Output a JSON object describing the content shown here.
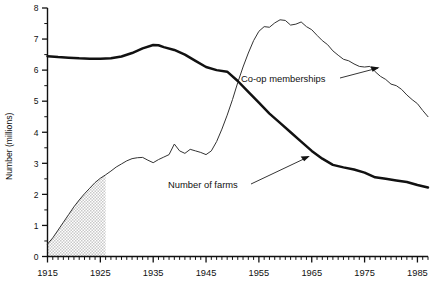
{
  "chart_data": {
    "type": "line",
    "title": "",
    "xlabel": "",
    "ylabel": "Number (millions)",
    "xlim": [
      1915,
      1987
    ],
    "ylim": [
      0,
      8
    ],
    "grid": false,
    "legend_position": "inline-annotations",
    "x_ticks": [
      1915,
      1925,
      1935,
      1945,
      1955,
      1965,
      1975,
      1985
    ],
    "x_tick_labels": [
      "1915",
      "1925",
      "1935",
      "1945",
      "1955",
      "1965",
      "1975",
      "1985"
    ],
    "x_minor_tick_interval": 1,
    "y_ticks": [
      0,
      1,
      2,
      3,
      4,
      5,
      6,
      7,
      8
    ],
    "y_tick_labels": [
      "0",
      "1",
      "2",
      "3",
      "4",
      "5",
      "6",
      "7",
      "8"
    ],
    "y_minor_tick_interval": 0.5,
    "annotations": [
      {
        "text": "Co-op memberships",
        "points_to": "coop-series"
      },
      {
        "text": "Number of farms",
        "points_to": "farms-series"
      }
    ],
    "shaded_region": {
      "label": "estimated",
      "x_from": 1915,
      "x_to": 1926,
      "under_series": "Co-op memberships"
    },
    "series": [
      {
        "name": "Number of farms",
        "style": "thick",
        "x": [
          1915,
          1917,
          1919,
          1921,
          1923,
          1925,
          1927,
          1929,
          1931,
          1933,
          1935,
          1936,
          1937,
          1939,
          1941,
          1943,
          1945,
          1947,
          1949,
          1951,
          1953,
          1955,
          1957,
          1959,
          1961,
          1963,
          1965,
          1967,
          1969,
          1971,
          1973,
          1975,
          1977,
          1979,
          1981,
          1983,
          1985,
          1987
        ],
        "values": [
          6.45,
          6.42,
          6.4,
          6.38,
          6.37,
          6.37,
          6.38,
          6.44,
          6.55,
          6.7,
          6.81,
          6.8,
          6.74,
          6.65,
          6.5,
          6.3,
          6.1,
          6.0,
          5.95,
          5.65,
          5.3,
          4.95,
          4.6,
          4.3,
          4.0,
          3.7,
          3.4,
          3.15,
          2.95,
          2.87,
          2.8,
          2.7,
          2.55,
          2.5,
          2.45,
          2.4,
          2.3,
          2.22
        ]
      },
      {
        "name": "Co-op memberships",
        "style": "thin",
        "x": [
          1915,
          1916,
          1917,
          1918,
          1919,
          1920,
          1921,
          1922,
          1923,
          1924,
          1925,
          1926,
          1927,
          1928,
          1929,
          1930,
          1931,
          1932,
          1933,
          1934,
          1935,
          1936,
          1937,
          1938,
          1939,
          1940,
          1941,
          1942,
          1943,
          1944,
          1945,
          1946,
          1947,
          1948,
          1949,
          1950,
          1951,
          1952,
          1953,
          1954,
          1955,
          1956,
          1957,
          1958,
          1959,
          1960,
          1961,
          1962,
          1963,
          1964,
          1965,
          1966,
          1967,
          1968,
          1969,
          1970,
          1971,
          1972,
          1973,
          1974,
          1975,
          1976,
          1977,
          1978,
          1979,
          1980,
          1981,
          1982,
          1983,
          1984,
          1985,
          1986,
          1987
        ],
        "values": [
          0.4,
          0.6,
          0.85,
          1.1,
          1.35,
          1.6,
          1.82,
          2.02,
          2.2,
          2.38,
          2.52,
          2.63,
          2.75,
          2.88,
          2.98,
          3.08,
          3.15,
          3.18,
          3.19,
          3.1,
          3.02,
          3.12,
          3.2,
          3.28,
          3.62,
          3.4,
          3.32,
          3.45,
          3.4,
          3.35,
          3.28,
          3.4,
          3.7,
          4.1,
          4.55,
          5.05,
          5.6,
          6.1,
          6.55,
          6.95,
          7.25,
          7.4,
          7.38,
          7.52,
          7.62,
          7.6,
          7.45,
          7.48,
          7.55,
          7.4,
          7.3,
          7.12,
          6.95,
          6.82,
          6.62,
          6.48,
          6.35,
          6.3,
          6.2,
          6.12,
          6.1,
          6.12,
          5.95,
          5.8,
          5.7,
          5.55,
          5.5,
          5.38,
          5.2,
          5.05,
          4.92,
          4.7,
          4.5
        ]
      }
    ]
  },
  "axis": {
    "y_title": "Number (millions)"
  }
}
